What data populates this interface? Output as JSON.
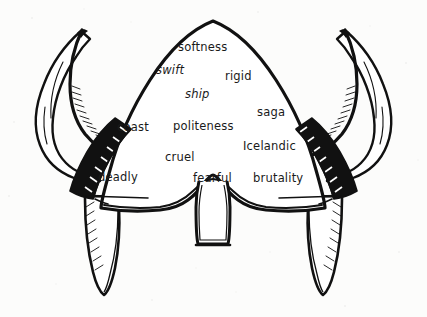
{
  "figure": {
    "kind": "line-drawing",
    "caption": "",
    "background_color": "#fcfcfb",
    "ink_color": "#111111",
    "stud_color": "#ffffff"
  },
  "words": [
    {
      "text": "softness",
      "x": 178,
      "y": 41,
      "style": "normal"
    },
    {
      "text": "swift",
      "x": 156,
      "y": 64,
      "style": "italic"
    },
    {
      "text": "rigid",
      "x": 225,
      "y": 70,
      "style": "normal"
    },
    {
      "text": "ship",
      "x": 185,
      "y": 88,
      "style": "italic"
    },
    {
      "text": "saga",
      "x": 257,
      "y": 106,
      "style": "normal"
    },
    {
      "text": "coast",
      "x": 117,
      "y": 121,
      "style": "normal"
    },
    {
      "text": "politeness",
      "x": 173,
      "y": 120,
      "style": "normal"
    },
    {
      "text": "cruel",
      "x": 165,
      "y": 151,
      "style": "normal"
    },
    {
      "text": "Icelandic",
      "x": 243,
      "y": 140,
      "style": "normal"
    },
    {
      "text": "deadly",
      "x": 98,
      "y": 171,
      "style": "normal"
    },
    {
      "text": "fearful",
      "x": 193,
      "y": 172,
      "style": "normal"
    },
    {
      "text": "brutality",
      "x": 253,
      "y": 172,
      "style": "normal"
    }
  ]
}
